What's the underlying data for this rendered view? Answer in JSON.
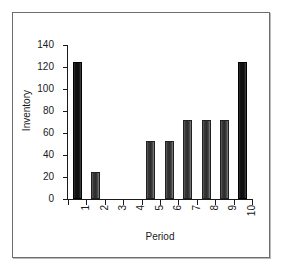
{
  "figure": {
    "frame_color": "#6e6e6e",
    "background": "#ffffff"
  },
  "chart_data": {
    "type": "bar",
    "title": "",
    "xlabel": "Period",
    "ylabel": "Inventory",
    "categories": [
      "1",
      "2",
      "3",
      "4",
      "5",
      "6",
      "7",
      "8",
      "9",
      "10"
    ],
    "values": [
      125,
      25,
      0,
      0,
      53,
      53,
      72,
      72,
      72,
      125
    ],
    "ylim": [
      0,
      140
    ],
    "ytick_values": [
      0,
      20,
      40,
      60,
      80,
      100,
      120,
      140
    ],
    "ytick_labels": [
      "0",
      "20",
      "40",
      "60",
      "80",
      "100",
      "120",
      "140"
    ],
    "grid": false,
    "legend": false,
    "legend_position": "none",
    "bar_color": "#2b2b2b",
    "bar_edge_color": "#000000",
    "xtick_rotation": 90,
    "ylabel_rotation": 90,
    "series": [
      {
        "name": "Inventory",
        "values": [
          125,
          25,
          0,
          0,
          53,
          53,
          72,
          72,
          72,
          125
        ]
      }
    ]
  }
}
